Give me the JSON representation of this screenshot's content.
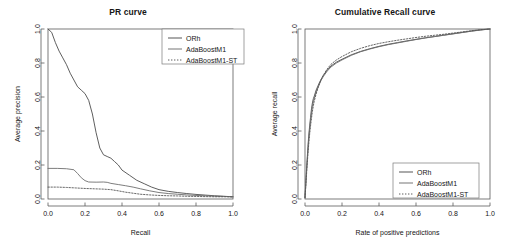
{
  "figure": {
    "background": "#ffffff",
    "axis_color": "#5a5a5a",
    "text_color": "#151515"
  },
  "chart_data": [
    {
      "id": "pr-curve",
      "type": "line",
      "title": "PR curve",
      "xlabel": "Recall",
      "ylabel": "Average precision",
      "xlim": [
        0.0,
        1.0
      ],
      "ylim": [
        0.0,
        1.0
      ],
      "xticks": [
        "0.0",
        "0.2",
        "0.4",
        "0.6",
        "0.8",
        "1.0"
      ],
      "xtickvals": [
        0.0,
        0.2,
        0.4,
        0.6,
        0.8,
        1.0
      ],
      "yticks": [
        "0.0",
        "0.2",
        "0.4",
        "0.6",
        "0.8",
        "1.0"
      ],
      "ytickvals": [
        0.0,
        0.2,
        0.4,
        0.6,
        0.8,
        1.0
      ],
      "grid": false,
      "legend_position": "top-right",
      "legend": [
        "ORh",
        "AdaBoostM1",
        "AdaBoostM1-ST"
      ],
      "series": [
        {
          "name": "ORh",
          "color": "#4d4d4d",
          "dash": "none",
          "x": [
            0.0,
            0.02,
            0.04,
            0.06,
            0.08,
            0.1,
            0.12,
            0.14,
            0.16,
            0.18,
            0.2,
            0.22,
            0.24,
            0.26,
            0.28,
            0.3,
            0.32,
            0.34,
            0.36,
            0.38,
            0.4,
            0.44,
            0.48,
            0.52,
            0.56,
            0.6,
            0.65,
            0.7,
            0.75,
            0.8,
            0.85,
            0.9,
            0.95,
            1.0
          ],
          "y": [
            1.0,
            0.98,
            0.92,
            0.87,
            0.83,
            0.79,
            0.74,
            0.7,
            0.66,
            0.64,
            0.62,
            0.58,
            0.5,
            0.39,
            0.3,
            0.26,
            0.25,
            0.24,
            0.22,
            0.2,
            0.17,
            0.14,
            0.11,
            0.09,
            0.07,
            0.055,
            0.045,
            0.038,
            0.032,
            0.027,
            0.023,
            0.019,
            0.016,
            0.013
          ]
        },
        {
          "name": "AdaBoostM1",
          "color": "#6e6e6e",
          "dash": "none",
          "x": [
            0.0,
            0.05,
            0.1,
            0.14,
            0.16,
            0.18,
            0.2,
            0.22,
            0.26,
            0.3,
            0.32,
            0.34,
            0.38,
            0.42,
            0.46,
            0.5,
            0.55,
            0.6,
            0.65,
            0.7,
            0.75,
            0.8,
            0.85,
            0.9,
            0.95,
            1.0
          ],
          "y": [
            0.18,
            0.18,
            0.178,
            0.172,
            0.15,
            0.125,
            0.108,
            0.1,
            0.099,
            0.1,
            0.098,
            0.092,
            0.085,
            0.078,
            0.07,
            0.06,
            0.048,
            0.038,
            0.032,
            0.028,
            0.024,
            0.021,
            0.019,
            0.017,
            0.015,
            0.013
          ]
        },
        {
          "name": "AdaBoostM1-ST",
          "color": "#555555",
          "dash": "dotted",
          "x": [
            0.0,
            0.05,
            0.1,
            0.15,
            0.2,
            0.25,
            0.3,
            0.34,
            0.38,
            0.42,
            0.46,
            0.5,
            0.55,
            0.6,
            0.65,
            0.7,
            0.75,
            0.8,
            0.85,
            0.9,
            0.95,
            1.0
          ],
          "y": [
            0.07,
            0.07,
            0.068,
            0.065,
            0.062,
            0.06,
            0.058,
            0.055,
            0.048,
            0.04,
            0.034,
            0.028,
            0.024,
            0.021,
            0.019,
            0.018,
            0.016,
            0.015,
            0.014,
            0.013,
            0.013,
            0.012
          ]
        }
      ]
    },
    {
      "id": "cumulative-recall-curve",
      "type": "line",
      "title": "Cumulative Recall curve",
      "xlabel": "Rate of positive predictions",
      "ylabel": "Average recall",
      "xlim": [
        0.0,
        1.0
      ],
      "ylim": [
        0.0,
        1.0
      ],
      "xticks": [
        "0.0",
        "0.2",
        "0.4",
        "0.6",
        "0.8",
        "1.0"
      ],
      "xtickvals": [
        0.0,
        0.2,
        0.4,
        0.6,
        0.8,
        1.0
      ],
      "yticks": [
        "0.0",
        "0.2",
        "0.4",
        "0.6",
        "0.8",
        "1.0"
      ],
      "ytickvals": [
        0.0,
        0.2,
        0.4,
        0.6,
        0.8,
        1.0
      ],
      "grid": false,
      "legend_position": "bottom-right",
      "legend": [
        "ORh",
        "AdaBoostM1",
        "AdaBoostM1-ST"
      ],
      "series": [
        {
          "name": "ORh",
          "color": "#4d4d4d",
          "dash": "none",
          "x": [
            0.0,
            0.004,
            0.008,
            0.012,
            0.016,
            0.02,
            0.025,
            0.03,
            0.035,
            0.04,
            0.045,
            0.05,
            0.06,
            0.07,
            0.08,
            0.09,
            0.1,
            0.12,
            0.14,
            0.17,
            0.2,
            0.25,
            0.3,
            0.35,
            0.4,
            0.45,
            0.5,
            0.55,
            0.6,
            0.65,
            0.7,
            0.75,
            0.8,
            0.85,
            0.9,
            0.95,
            1.0
          ],
          "y": [
            0.01,
            0.09,
            0.17,
            0.24,
            0.31,
            0.37,
            0.43,
            0.48,
            0.53,
            0.565,
            0.59,
            0.605,
            0.64,
            0.665,
            0.69,
            0.71,
            0.728,
            0.758,
            0.782,
            0.805,
            0.822,
            0.848,
            0.868,
            0.884,
            0.898,
            0.91,
            0.92,
            0.93,
            0.939,
            0.948,
            0.956,
            0.964,
            0.972,
            0.98,
            0.988,
            0.995,
            1.0
          ]
        },
        {
          "name": "AdaBoostM1",
          "color": "#6e6e6e",
          "dash": "none",
          "x": [
            0.0,
            0.004,
            0.008,
            0.012,
            0.016,
            0.02,
            0.025,
            0.03,
            0.035,
            0.04,
            0.045,
            0.05,
            0.06,
            0.07,
            0.08,
            0.09,
            0.1,
            0.12,
            0.14,
            0.17,
            0.2,
            0.25,
            0.3,
            0.35,
            0.4,
            0.45,
            0.5,
            0.55,
            0.6,
            0.65,
            0.7,
            0.75,
            0.8,
            0.85,
            0.9,
            0.95,
            1.0
          ],
          "y": [
            0.008,
            0.08,
            0.155,
            0.225,
            0.29,
            0.35,
            0.41,
            0.46,
            0.505,
            0.545,
            0.572,
            0.592,
            0.628,
            0.656,
            0.682,
            0.704,
            0.722,
            0.752,
            0.776,
            0.8,
            0.818,
            0.845,
            0.866,
            0.882,
            0.896,
            0.908,
            0.918,
            0.928,
            0.938,
            0.947,
            0.955,
            0.963,
            0.971,
            0.979,
            0.987,
            0.994,
            1.0
          ]
        },
        {
          "name": "AdaBoostM1-ST",
          "color": "#555555",
          "dash": "dotted",
          "x": [
            0.0,
            0.004,
            0.008,
            0.012,
            0.016,
            0.02,
            0.025,
            0.03,
            0.035,
            0.04,
            0.045,
            0.05,
            0.06,
            0.07,
            0.08,
            0.09,
            0.1,
            0.12,
            0.14,
            0.17,
            0.2,
            0.25,
            0.3,
            0.35,
            0.4,
            0.45,
            0.5,
            0.55,
            0.6,
            0.65,
            0.7,
            0.75,
            0.8,
            0.85,
            0.9,
            0.95,
            1.0
          ],
          "y": [
            0.006,
            0.07,
            0.14,
            0.205,
            0.265,
            0.32,
            0.38,
            0.43,
            0.475,
            0.515,
            0.548,
            0.575,
            0.618,
            0.652,
            0.682,
            0.708,
            0.73,
            0.765,
            0.792,
            0.818,
            0.838,
            0.866,
            0.886,
            0.902,
            0.915,
            0.925,
            0.934,
            0.942,
            0.95,
            0.957,
            0.963,
            0.969,
            0.976,
            0.983,
            0.99,
            0.996,
            1.0
          ]
        }
      ]
    }
  ]
}
